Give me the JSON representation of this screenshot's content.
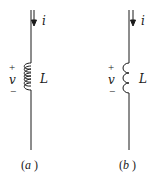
{
  "figure": {
    "panels": [
      {
        "id": "a",
        "caption": "(a)",
        "caption_letter": "a",
        "element": "inductor",
        "coil_style": "closed loops",
        "current_label": "i",
        "current_direction": "down",
        "voltage_label": "v",
        "voltage_plus": "+",
        "voltage_minus": "−",
        "inductance_label": "L"
      },
      {
        "id": "b",
        "caption": "(b)",
        "caption_letter": "b",
        "element": "inductor",
        "coil_style": "semicircle bumps",
        "current_label": "i",
        "current_direction": "down",
        "voltage_label": "v",
        "voltage_plus": "+",
        "voltage_minus": "−",
        "inductance_label": "L"
      }
    ],
    "colors": {
      "ink": "#1a1a1a",
      "background": "#ffffff"
    }
  }
}
